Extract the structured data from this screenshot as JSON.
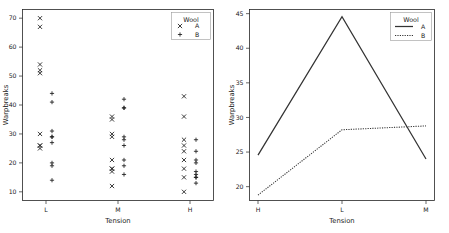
{
  "figure": {
    "background": "#ffffff",
    "ink_color": "#1a1a1a",
    "panels": [
      "strip",
      "interaction"
    ]
  },
  "chart_data": [
    {
      "type": "scatter",
      "panel": "left",
      "title": "",
      "xlabel": "Tension",
      "ylabel": "Warpbreaks",
      "categories": [
        "L",
        "M",
        "H"
      ],
      "xticklabels": [
        "L",
        "M",
        "H"
      ],
      "yticklabels": [
        "10",
        "20",
        "30",
        "40",
        "50",
        "60",
        "70"
      ],
      "yticks": [
        10,
        20,
        30,
        40,
        50,
        60,
        70
      ],
      "ylim": [
        7,
        73
      ],
      "grid": false,
      "legend": {
        "title": "Wool",
        "position": "upper right",
        "entries": [
          {
            "label": "A",
            "marker": "x"
          },
          {
            "label": "B",
            "marker": "+"
          }
        ]
      },
      "series": [
        {
          "name": "A",
          "marker": "x",
          "points": [
            {
              "x": "L",
              "y": 26
            },
            {
              "x": "L",
              "y": 30
            },
            {
              "x": "L",
              "y": 54
            },
            {
              "x": "L",
              "y": 25
            },
            {
              "x": "L",
              "y": 70
            },
            {
              "x": "L",
              "y": 52
            },
            {
              "x": "L",
              "y": 51
            },
            {
              "x": "L",
              "y": 26
            },
            {
              "x": "L",
              "y": 67
            },
            {
              "x": "M",
              "y": 18
            },
            {
              "x": "M",
              "y": 21
            },
            {
              "x": "M",
              "y": 29
            },
            {
              "x": "M",
              "y": 17
            },
            {
              "x": "M",
              "y": 12
            },
            {
              "x": "M",
              "y": 18
            },
            {
              "x": "M",
              "y": 35
            },
            {
              "x": "M",
              "y": 30
            },
            {
              "x": "M",
              "y": 36
            },
            {
              "x": "H",
              "y": 36
            },
            {
              "x": "H",
              "y": 21
            },
            {
              "x": "H",
              "y": 24
            },
            {
              "x": "H",
              "y": 18
            },
            {
              "x": "H",
              "y": 10
            },
            {
              "x": "H",
              "y": 43
            },
            {
              "x": "H",
              "y": 28
            },
            {
              "x": "H",
              "y": 15
            },
            {
              "x": "H",
              "y": 26
            }
          ]
        },
        {
          "name": "B",
          "marker": "+",
          "points": [
            {
              "x": "L",
              "y": 27
            },
            {
              "x": "L",
              "y": 14
            },
            {
              "x": "L",
              "y": 29
            },
            {
              "x": "L",
              "y": 19
            },
            {
              "x": "L",
              "y": 29
            },
            {
              "x": "L",
              "y": 31
            },
            {
              "x": "L",
              "y": 41
            },
            {
              "x": "L",
              "y": 20
            },
            {
              "x": "L",
              "y": 44
            },
            {
              "x": "M",
              "y": 42
            },
            {
              "x": "M",
              "y": 26
            },
            {
              "x": "M",
              "y": 19
            },
            {
              "x": "M",
              "y": 16
            },
            {
              "x": "M",
              "y": 39
            },
            {
              "x": "M",
              "y": 28
            },
            {
              "x": "M",
              "y": 21
            },
            {
              "x": "M",
              "y": 39
            },
            {
              "x": "M",
              "y": 29
            },
            {
              "x": "H",
              "y": 20
            },
            {
              "x": "H",
              "y": 21
            },
            {
              "x": "H",
              "y": 24
            },
            {
              "x": "H",
              "y": 17
            },
            {
              "x": "H",
              "y": 13
            },
            {
              "x": "H",
              "y": 15
            },
            {
              "x": "H",
              "y": 15
            },
            {
              "x": "H",
              "y": 16
            },
            {
              "x": "H",
              "y": 28
            }
          ]
        }
      ]
    },
    {
      "type": "line",
      "panel": "right",
      "title": "",
      "xlabel": "Tension",
      "ylabel": "Warpbreaks",
      "categories": [
        "H",
        "L",
        "M"
      ],
      "xticklabels": [
        "H",
        "L",
        "M"
      ],
      "yticklabels": [
        "20",
        "25",
        "30",
        "35",
        "40",
        "45"
      ],
      "yticks": [
        20,
        25,
        30,
        35,
        40,
        45
      ],
      "ylim": [
        18.0,
        45.6
      ],
      "grid": false,
      "legend": {
        "title": "Wool",
        "position": "upper right",
        "entries": [
          {
            "label": "A",
            "style": "solid"
          },
          {
            "label": "B",
            "style": "dotted"
          }
        ]
      },
      "series": [
        {
          "name": "A",
          "style": "solid",
          "values": [
            24.56,
            44.56,
            24.0
          ]
        },
        {
          "name": "B",
          "style": "dotted",
          "values": [
            18.78,
            28.22,
            28.78
          ]
        }
      ]
    }
  ]
}
